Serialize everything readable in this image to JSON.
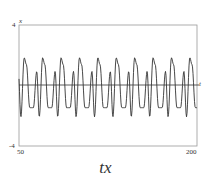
{
  "chart_data": {
    "type": "line",
    "title": "",
    "caption": "tx",
    "xlabel": "t",
    "ylabel": "x",
    "xlim": [
      50,
      200
    ],
    "ylim": [
      -4,
      4
    ],
    "x_ticks": [
      "50",
      "200"
    ],
    "y_ticks": [
      "4",
      "-4"
    ],
    "grid": false,
    "legend": null,
    "series": [
      {
        "name": "x(t)",
        "description": "Periodic oscillation (~10 periods over t=50..200); each period has a tall peak near x≈1.8, a smaller peak near x≈0.9, a deep trough near x≈-2.1 and a shallow trough near x≈-1.5",
        "x": [
          50,
          52,
          54,
          56,
          58,
          60,
          62,
          64,
          66,
          68,
          70,
          72,
          74,
          76,
          78,
          80,
          82,
          84,
          86,
          88,
          90,
          92,
          94,
          96,
          98,
          100
        ],
        "y": [
          -0.5,
          -1.5,
          -1.2,
          0.9,
          -0.5,
          -2.1,
          1.8,
          1.3,
          0.4,
          -1.5,
          0.9,
          -0.5,
          -2.1,
          1.8,
          1.3,
          0.4,
          -1.5,
          0.9,
          -0.5,
          -2.1,
          1.8,
          1.3,
          0.4,
          -1.5,
          0.9,
          -2.1
        ],
        "period_approx": 15,
        "tall_peak": 1.8,
        "small_peak": 0.9,
        "deep_trough": -2.1,
        "shallow_trough": -1.5
      }
    ]
  },
  "labels": {
    "y_top": "4",
    "y_bottom": "-4",
    "x_left": "50",
    "x_right": "200",
    "y_axis_name": "x",
    "x_axis_name": "t",
    "caption": "tx"
  },
  "colors": {
    "line": "#333333",
    "frame": "#888888"
  }
}
